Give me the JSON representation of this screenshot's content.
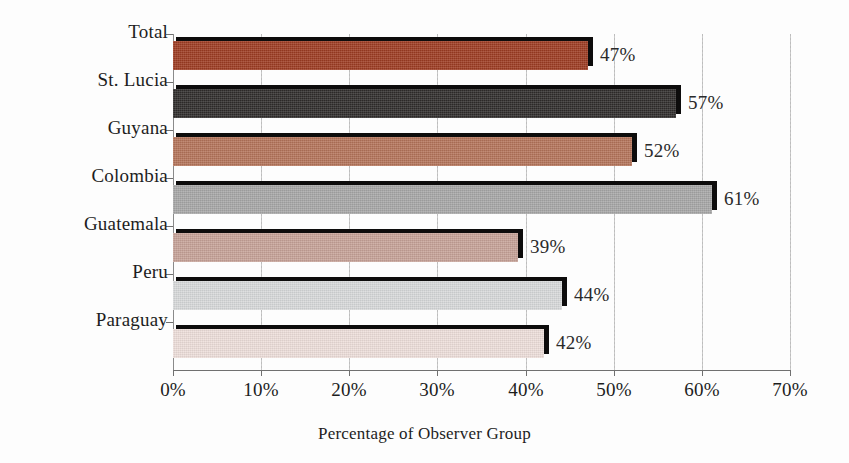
{
  "chart_data": {
    "type": "bar",
    "orientation": "horizontal",
    "title": "",
    "xlabel": "Percentage of Observer Group",
    "ylabel": "",
    "categories": [
      "Total",
      "St. Lucia",
      "Guyana",
      "Colombia",
      "Guatemala",
      "Peru",
      "Paraguay"
    ],
    "values": [
      47,
      57,
      52,
      61,
      39,
      44,
      42
    ],
    "data_labels": [
      "47%",
      "57%",
      "52%",
      "61%",
      "39%",
      "44%",
      "42%"
    ],
    "xlim": [
      0,
      70
    ],
    "xticks": [
      0,
      10,
      20,
      30,
      40,
      50,
      60,
      70
    ],
    "xtick_labels": [
      "0%",
      "10%",
      "20%",
      "30%",
      "40%",
      "50%",
      "60%",
      "70%"
    ],
    "grid": "vertical-dotted",
    "legend": "none",
    "bar_colors": [
      "#9e3c22",
      "#302d2c",
      "#b5745a",
      "#a8a8a8",
      "#c7a398",
      "#d8dadb",
      "#eedfdb"
    ],
    "bar_shadow_color": "#0d0c0c",
    "background_color": "#fdfdfd",
    "axis_color": "#707070",
    "gridline_color": "#c9c9c9",
    "text_color": "#1d1d1d"
  },
  "axis": {
    "x_title": "Percentage of Observer Group"
  }
}
